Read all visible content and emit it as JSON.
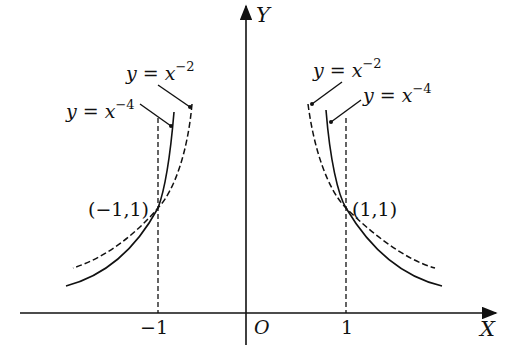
{
  "axes": {
    "x_label": "X",
    "y_label": "Y",
    "origin_label": "O",
    "ticks": [
      {
        "value": -1,
        "label": "-1"
      },
      {
        "value": 1,
        "label": "1"
      }
    ]
  },
  "curves": [
    {
      "name": "y = x^-2",
      "label_prefix": "y = x",
      "exponent": "−2",
      "style": "dashed"
    },
    {
      "name": "y = x^-4",
      "label_prefix": "y = x",
      "exponent": "−4",
      "style": "solid"
    }
  ],
  "points": [
    {
      "label": "(−1,1)",
      "x": -1,
      "y": 1
    },
    {
      "label": "(1,1)",
      "x": 1,
      "y": 1
    }
  ]
}
